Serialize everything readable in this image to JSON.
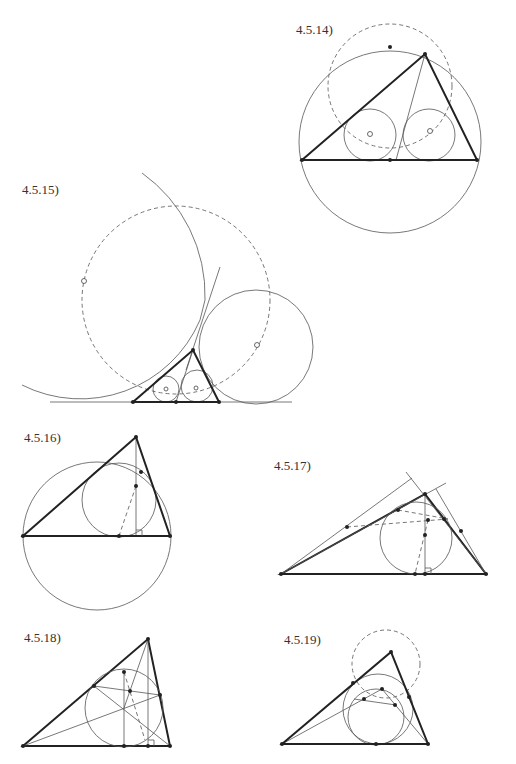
{
  "figures": [
    {
      "id": "fig-4-5-14",
      "label": "4.5.14)"
    },
    {
      "id": "fig-4-5-15",
      "label": "4.5.15)"
    },
    {
      "id": "fig-4-5-16",
      "label": "4.5.16)"
    },
    {
      "id": "fig-4-5-17",
      "label": "4.5.17)"
    },
    {
      "id": "fig-4-5-18",
      "label": "4.5.18)"
    },
    {
      "id": "fig-4-5-19",
      "label": "4.5.19)"
    }
  ],
  "colors": {
    "stroke": "#222222",
    "thin": "#555555",
    "dashed": "#666666",
    "background": "#ffffff"
  }
}
